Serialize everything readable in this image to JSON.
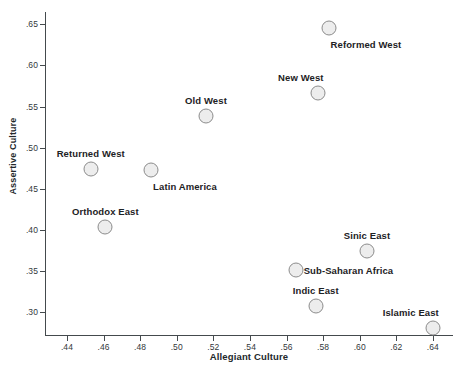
{
  "chart_data": {
    "type": "scatter",
    "title": "",
    "xlabel": "Allegiant Culture",
    "ylabel": "Assertive Culture",
    "xlim": [
      0.428,
      0.651
    ],
    "ylim": [
      0.272,
      0.665
    ],
    "xticks": [
      ".44",
      ".46",
      ".48",
      ".50",
      ".52",
      ".54",
      ".56",
      ".58",
      ".60",
      ".62",
      ".64"
    ],
    "xtick_values": [
      0.44,
      0.46,
      0.48,
      0.5,
      0.52,
      0.54,
      0.56,
      0.58,
      0.6,
      0.62,
      0.64
    ],
    "yticks": [
      ".65",
      ".60",
      ".55",
      ".50",
      ".45",
      ".40",
      ".35",
      ".30"
    ],
    "ytick_values": [
      0.65,
      0.6,
      0.55,
      0.5,
      0.45,
      0.4,
      0.35,
      0.3
    ],
    "grid": false,
    "legend": "none",
    "marker_color": "#ededed",
    "marker_edge_color": "#8c8c8c",
    "axis_color": "#444a4d",
    "points": [
      {
        "label": "Reformed West",
        "x": 0.583,
        "y": 0.646,
        "label_pos": "below-right"
      },
      {
        "label": "New West",
        "x": 0.577,
        "y": 0.566,
        "label_pos": "above-left"
      },
      {
        "label": "Old West",
        "x": 0.516,
        "y": 0.538,
        "label_pos": "above"
      },
      {
        "label": "Returned West",
        "x": 0.453,
        "y": 0.474,
        "label_pos": "above"
      },
      {
        "label": "Latin America",
        "x": 0.486,
        "y": 0.473,
        "label_pos": "below-right"
      },
      {
        "label": "Orthodox East",
        "x": 0.461,
        "y": 0.404,
        "label_pos": "above"
      },
      {
        "label": "Sinic East",
        "x": 0.604,
        "y": 0.374,
        "label_pos": "above"
      },
      {
        "label": "Sub-Saharan Africa",
        "x": 0.565,
        "y": 0.351,
        "label_pos": "right"
      },
      {
        "label": "Indic East",
        "x": 0.576,
        "y": 0.307,
        "label_pos": "above"
      },
      {
        "label": "Islamic East",
        "x": 0.64,
        "y": 0.28,
        "label_pos": "above-left"
      }
    ]
  }
}
